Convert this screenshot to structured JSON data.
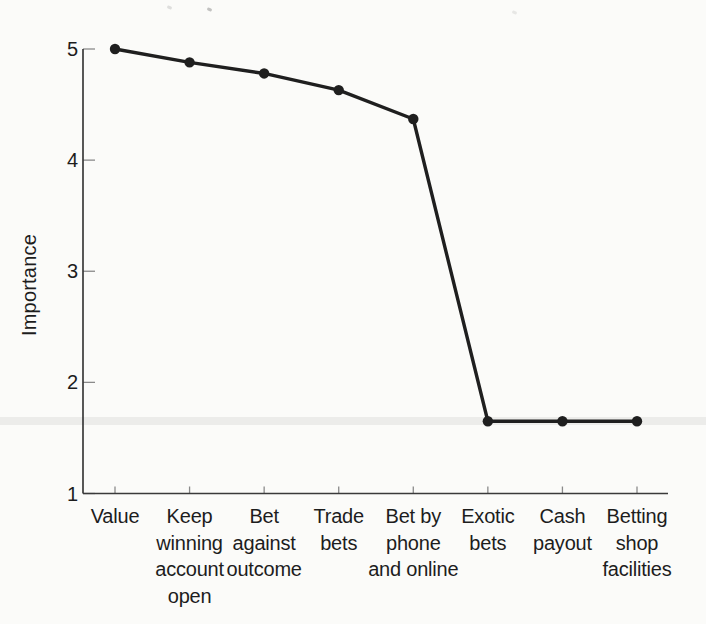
{
  "chart_data": {
    "type": "line",
    "title": "",
    "xlabel": "",
    "ylabel": "Importance",
    "categories": [
      "Value",
      "Keep\nwinning\naccount\nopen",
      "Bet\nagainst\noutcome",
      "Trade\nbets",
      "Bet by\nphone\nand online",
      "Exotic\nbets",
      "Cash\npayout",
      "Betting\nshop\nfacilities"
    ],
    "values": [
      5.0,
      4.88,
      4.78,
      4.63,
      4.37,
      1.65,
      1.65,
      1.65
    ],
    "ylim": [
      1,
      5
    ],
    "yticks": [
      5,
      4,
      3,
      2,
      1
    ],
    "grid": false,
    "legend_position": "none",
    "marker": "circle"
  },
  "colors": {
    "line": "#1f1f1f",
    "marker": "#1f1f1f",
    "axis": "#3a3a3a",
    "tick": "#8a8a8a",
    "text": "#1d1d1d",
    "background": "#fbfbf9",
    "artifact_band": "rgba(60,60,60,0.08)"
  }
}
